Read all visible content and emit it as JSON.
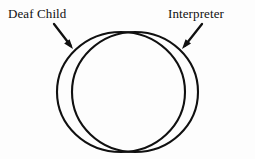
{
  "figure": {
    "background_color": "#fdfdfd",
    "stroke_color": "#101010",
    "text_color": "#101010"
  },
  "labels": {
    "left": {
      "text": "Deaf Child",
      "icon": "text-label",
      "refers_to": "left-circle"
    },
    "right": {
      "text": "Interpreter",
      "icon": "text-label",
      "refers_to": "right-circle"
    }
  },
  "shapes": {
    "left_circle": {
      "name": "Deaf Child",
      "cx": 121,
      "cy": 92,
      "rx": 64,
      "ry": 60,
      "fill": "none",
      "stroke": "#101010",
      "stroke_width": 2
    },
    "right_circle": {
      "name": "Interpreter",
      "cx": 135,
      "cy": 92,
      "rx": 63,
      "ry": 60,
      "fill": "none",
      "stroke": "#101010",
      "stroke_width": 2
    }
  },
  "arrows": {
    "left": {
      "icon": "arrow-down-right-icon",
      "from_x": 54,
      "from_y": 24,
      "to_x": 73,
      "to_y": 49
    },
    "right": {
      "icon": "arrow-down-left-icon",
      "from_x": 202,
      "from_y": 24,
      "to_x": 182,
      "to_y": 49
    }
  },
  "chart_data": {
    "type": "diagram",
    "subtype": "venn",
    "sets": [
      {
        "label": "Deaf Child",
        "cx": 121,
        "cy": 92,
        "r": 62
      },
      {
        "label": "Interpreter",
        "cx": 135,
        "cy": 92,
        "r": 62
      }
    ],
    "relationship": "near-complete overlap, offset horizontally by 14 px",
    "legend": "none",
    "grid": false
  }
}
